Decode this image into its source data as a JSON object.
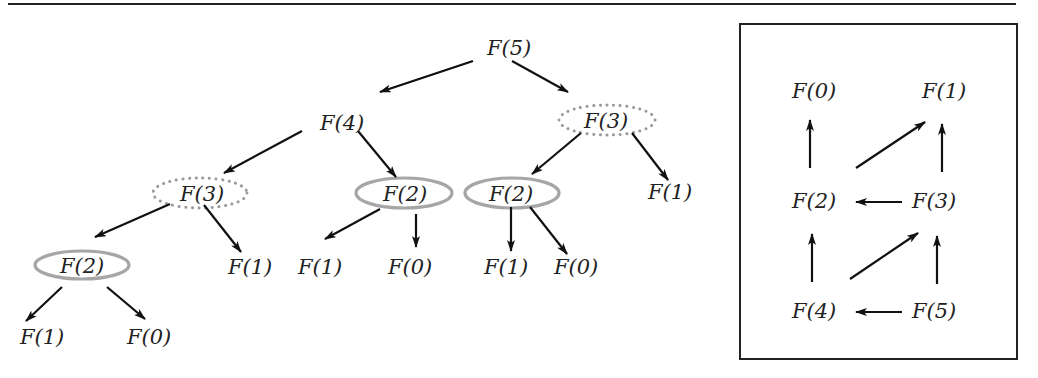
{
  "colors": {
    "text": "#222222",
    "arrow": "#111111",
    "solid_highlight": "#a6a6a6",
    "dotted_highlight": "#999999",
    "frame": "#222222"
  },
  "tree": {
    "nodes": [
      {
        "id": "t5",
        "label": "F(5)",
        "x": 487,
        "y": 55,
        "ring": "none"
      },
      {
        "id": "t4",
        "label": "F(4)",
        "x": 320,
        "y": 130,
        "ring": "none"
      },
      {
        "id": "t3r",
        "label": "F(3)",
        "x": 584,
        "y": 128,
        "ring": "dotted"
      },
      {
        "id": "t3l",
        "label": "F(3)",
        "x": 180,
        "y": 201,
        "ring": "dotted"
      },
      {
        "id": "t2a",
        "label": "F(2)",
        "x": 383,
        "y": 201,
        "ring": "solid"
      },
      {
        "id": "t2b",
        "label": "F(2)",
        "x": 489,
        "y": 201,
        "ring": "solid"
      },
      {
        "id": "t1r",
        "label": "F(1)",
        "x": 648,
        "y": 199,
        "ring": "none"
      },
      {
        "id": "t2l",
        "label": "F(2)",
        "x": 60,
        "y": 273,
        "ring": "solid"
      },
      {
        "id": "t1m",
        "label": "F(1)",
        "x": 228,
        "y": 274,
        "ring": "none"
      },
      {
        "id": "t1c",
        "label": "F(1)",
        "x": 298,
        "y": 274,
        "ring": "none"
      },
      {
        "id": "t0c",
        "label": "F(0)",
        "x": 388,
        "y": 274,
        "ring": "none"
      },
      {
        "id": "t1d",
        "label": "F(1)",
        "x": 484,
        "y": 274,
        "ring": "none"
      },
      {
        "id": "t0d",
        "label": "F(0)",
        "x": 554,
        "y": 274,
        "ring": "none"
      },
      {
        "id": "t1e",
        "label": "F(1)",
        "x": 20,
        "y": 344,
        "ring": "none"
      },
      {
        "id": "t0e",
        "label": "F(0)",
        "x": 127,
        "y": 344,
        "ring": "none"
      }
    ]
  },
  "dag": {
    "nodes": [
      {
        "id": "d0",
        "label": "F(0)",
        "x": 792,
        "y": 98
      },
      {
        "id": "d1",
        "label": "F(1)",
        "x": 922,
        "y": 98
      },
      {
        "id": "d2",
        "label": "F(2)",
        "x": 792,
        "y": 208
      },
      {
        "id": "d3",
        "label": "F(3)",
        "x": 912,
        "y": 208
      },
      {
        "id": "d4",
        "label": "F(4)",
        "x": 792,
        "y": 318
      },
      {
        "id": "d5",
        "label": "F(5)",
        "x": 912,
        "y": 318
      }
    ]
  }
}
